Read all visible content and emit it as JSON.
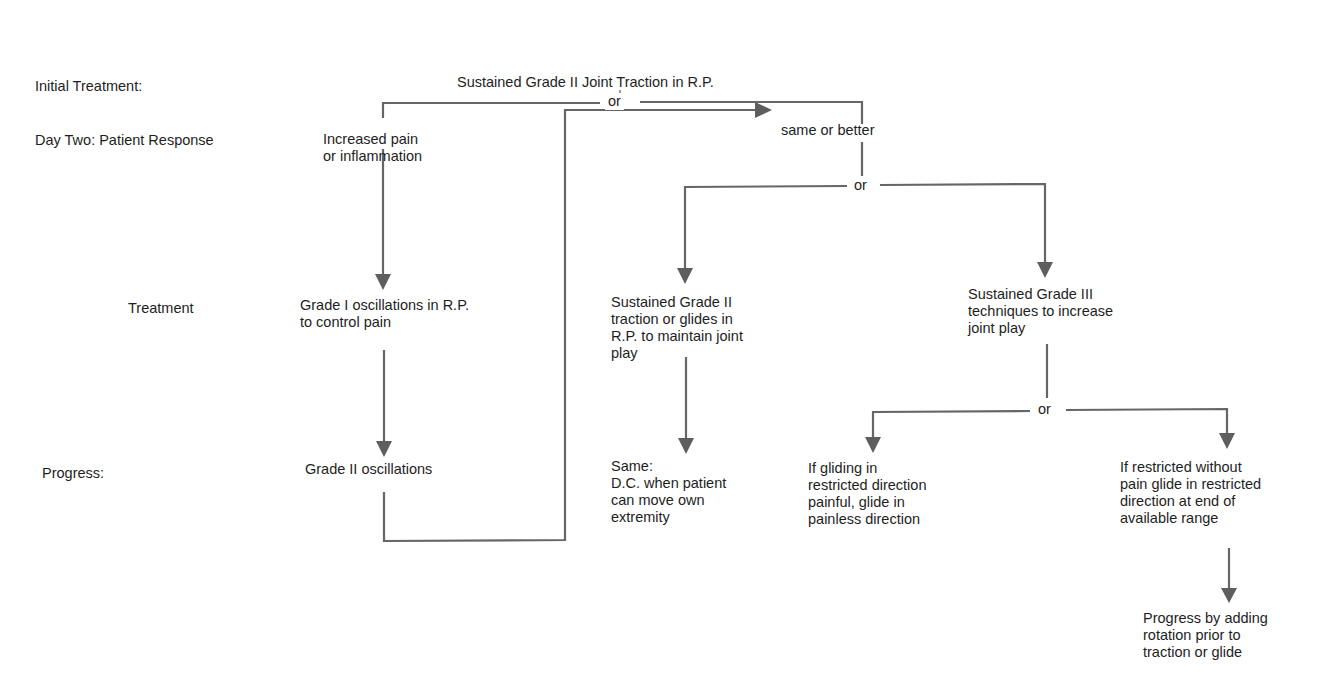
{
  "row_labels": {
    "initial": "Initial Treatment:",
    "day_two": "Day Two: Patient Response",
    "treatment": "Treatment",
    "progress": "Progress:"
  },
  "connector_label": "or",
  "nodes": {
    "root": [
      "Sustained Grade II Joint Traction in R.P."
    ],
    "increased_pain": [
      "Increased pain",
      "or inflammation"
    ],
    "same_or_better": [
      "same or better"
    ],
    "grade1": [
      "Grade I oscillations in R.P.",
      "to control pain"
    ],
    "grade2_osc": [
      "Grade II oscillations"
    ],
    "sustained_grade2": [
      "Sustained Grade II",
      "traction or glides in",
      "R.P. to maintain joint",
      "play"
    ],
    "sustained_grade3": [
      "Sustained Grade III",
      "techniques to increase",
      "joint play"
    ],
    "same_dc": [
      "Same:",
      "D.C. when patient",
      "can move own",
      "extremity"
    ],
    "gliding_painful": [
      "If gliding in",
      "restricted direction",
      "painful, glide in",
      "painless direction"
    ],
    "restricted_without_pain": [
      "If restricted without",
      "pain glide in restricted",
      "direction at end of",
      "available range"
    ],
    "progress_rotation": [
      "Progress by adding",
      "rotation prior to",
      "traction or glide"
    ]
  },
  "colors": {
    "line": "#666666",
    "arrow": "#5e5e5e",
    "text": "#1e1e1e"
  }
}
